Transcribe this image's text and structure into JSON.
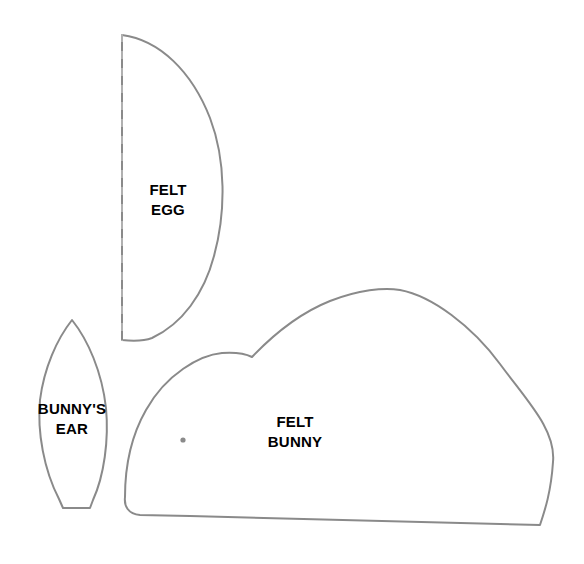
{
  "document": {
    "title": "Felt Bunny and Egg Sewing Template",
    "background_color": "#ffffff",
    "outline_color": "#8a8a8a",
    "fold_line_color": "#b0b0b0",
    "label_color": "#000000",
    "width": 584,
    "height": 564
  },
  "pieces": [
    {
      "id": "felt-egg",
      "label": "FELT\nEGG",
      "label_line_1": "FELT",
      "label_line_2": "EGG",
      "has_fold_line": true,
      "fold_line_style": "dashed",
      "notes": "half egg shape, cut on fold"
    },
    {
      "id": "bunnys-ear",
      "label": "BUNNY'S\nEAR",
      "label_line_1": "BUNNY'S",
      "label_line_2": "EAR",
      "has_fold_line": false,
      "notes": "pointed leaf shape with flat base"
    },
    {
      "id": "felt-bunny",
      "label": "FELT\nBUNNY",
      "label_line_1": "FELT",
      "label_line_2": "BUNNY",
      "has_fold_line": false,
      "has_eye_marking": true,
      "notes": "bunny body silhouette with head and back humps"
    }
  ]
}
